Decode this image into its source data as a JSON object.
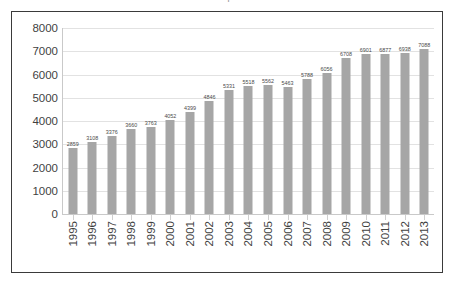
{
  "caption": {
    "text": "cut-off caption line"
  },
  "chart_data": {
    "type": "bar",
    "title": "",
    "xlabel": "",
    "ylabel": "",
    "ylim": [
      0,
      8000
    ],
    "ytick_labels": [
      "8000",
      "7000",
      "6000",
      "5000",
      "4000",
      "3000",
      "2000",
      "1000",
      "0"
    ],
    "ytick_values": [
      8000,
      7000,
      6000,
      5000,
      4000,
      3000,
      2000,
      1000,
      0
    ],
    "grid": true,
    "legend": false,
    "bar_color": "#a6a6a6",
    "categories": [
      "1995",
      "1996",
      "1997",
      "1998",
      "1999",
      "2000",
      "2001",
      "2002",
      "2003",
      "2004",
      "2005",
      "2006",
      "2007",
      "2008",
      "2009",
      "2010",
      "2011",
      "2012",
      "2013"
    ],
    "values": [
      2859,
      3108,
      3376,
      3660,
      3763,
      4052,
      4399,
      4846,
      5331,
      5518,
      5562,
      5463,
      5788,
      6056,
      6708,
      6901,
      6877,
      6938,
      7088
    ],
    "data_labels": [
      "2859",
      "3108",
      "3376",
      "3660",
      "3763",
      "4052",
      "4399",
      "4846",
      "5331",
      "5518",
      "5562",
      "5463",
      "5788",
      "6056",
      "6708",
      "6901",
      "6877",
      "6938",
      "7088"
    ]
  }
}
